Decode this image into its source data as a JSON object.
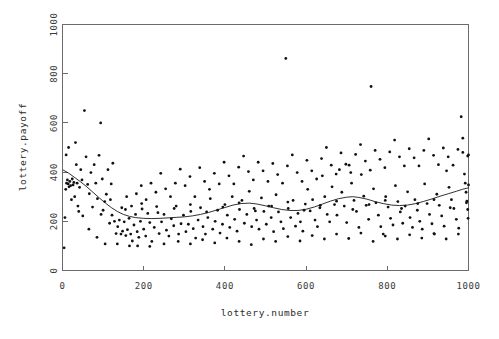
{
  "chart_data": {
    "type": "scatter",
    "title": "",
    "xlabel": "lottery.number",
    "ylabel": "lottery.payoff",
    "xlim": [
      0,
      1000
    ],
    "ylim": [
      0,
      1000
    ],
    "xticks": [
      0,
      200,
      400,
      600,
      800,
      1000
    ],
    "yticks": [
      0,
      200,
      400,
      600,
      800,
      1000
    ],
    "xtick_labels": [
      "0",
      "200",
      "400",
      "600",
      "800",
      "1000"
    ],
    "ytick_labels": [
      "0",
      "200",
      "400",
      "600",
      "800",
      "1000"
    ],
    "grid": false,
    "legend": null,
    "marker": "point",
    "marker_color": "#111111",
    "axis_color": "#6b6b6b",
    "curve": {
      "name": "lowess smooth",
      "color": "#1a1a1a",
      "points": [
        [
          2,
          408
        ],
        [
          15,
          396
        ],
        [
          30,
          378
        ],
        [
          45,
          360
        ],
        [
          60,
          340
        ],
        [
          75,
          318
        ],
        [
          90,
          296
        ],
        [
          105,
          275
        ],
        [
          120,
          256
        ],
        [
          135,
          240
        ],
        [
          150,
          228
        ],
        [
          165,
          220
        ],
        [
          180,
          215
        ],
        [
          200,
          212
        ],
        [
          220,
          211
        ],
        [
          240,
          212
        ],
        [
          260,
          214
        ],
        [
          280,
          216
        ],
        [
          300,
          218
        ],
        [
          320,
          222
        ],
        [
          340,
          228
        ],
        [
          360,
          236
        ],
        [
          380,
          246
        ],
        [
          400,
          256
        ],
        [
          420,
          266
        ],
        [
          440,
          272
        ],
        [
          460,
          274
        ],
        [
          480,
          270
        ],
        [
          500,
          263
        ],
        [
          520,
          255
        ],
        [
          540,
          248
        ],
        [
          560,
          244
        ],
        [
          580,
          244
        ],
        [
          600,
          249
        ],
        [
          620,
          258
        ],
        [
          640,
          270
        ],
        [
          660,
          282
        ],
        [
          680,
          292
        ],
        [
          700,
          298
        ],
        [
          715,
          300
        ],
        [
          730,
          297
        ],
        [
          750,
          290
        ],
        [
          770,
          280
        ],
        [
          790,
          272
        ],
        [
          810,
          266
        ],
        [
          830,
          264
        ],
        [
          850,
          266
        ],
        [
          870,
          272
        ],
        [
          890,
          281
        ],
        [
          910,
          291
        ],
        [
          930,
          302
        ],
        [
          950,
          312
        ],
        [
          970,
          322
        ],
        [
          985,
          330
        ],
        [
          1000,
          336
        ]
      ]
    },
    "points": [
      [
        4,
        92
      ],
      [
        6,
        215
      ],
      [
        8,
        330
      ],
      [
        9,
        470
      ],
      [
        10,
        355
      ],
      [
        12,
        368
      ],
      [
        14,
        352
      ],
      [
        15,
        500
      ],
      [
        16,
        340
      ],
      [
        18,
        362
      ],
      [
        20,
        345
      ],
      [
        22,
        288
      ],
      [
        24,
        372
      ],
      [
        26,
        348
      ],
      [
        28,
        358
      ],
      [
        30,
        300
      ],
      [
        32,
        520
      ],
      [
        34,
        430
      ],
      [
        36,
        355
      ],
      [
        38,
        262
      ],
      [
        40,
        240
      ],
      [
        42,
        338
      ],
      [
        45,
        410
      ],
      [
        48,
        368
      ],
      [
        50,
        222
      ],
      [
        54,
        650
      ],
      [
        58,
        462
      ],
      [
        62,
        350
      ],
      [
        66,
        312
      ],
      [
        70,
        398
      ],
      [
        74,
        258
      ],
      [
        78,
        430
      ],
      [
        82,
        355
      ],
      [
        86,
        292
      ],
      [
        90,
        468
      ],
      [
        94,
        600
      ],
      [
        98,
        372
      ],
      [
        100,
        245
      ],
      [
        104,
        280
      ],
      [
        108,
        310
      ],
      [
        112,
        410
      ],
      [
        116,
        192
      ],
      [
        120,
        352
      ],
      [
        124,
        436
      ],
      [
        128,
        200
      ],
      [
        132,
        150
      ],
      [
        136,
        178
      ],
      [
        140,
        205
      ],
      [
        144,
        148
      ],
      [
        148,
        160
      ],
      [
        152,
        198
      ],
      [
        156,
        142
      ],
      [
        160,
        166
      ],
      [
        164,
        212
      ],
      [
        168,
        148
      ],
      [
        172,
        120
      ],
      [
        176,
        185
      ],
      [
        180,
        228
      ],
      [
        184,
        158
      ],
      [
        188,
        135
      ],
      [
        192,
        200
      ],
      [
        196,
        250
      ],
      [
        200,
        168
      ],
      [
        205,
        140
      ],
      [
        210,
        232
      ],
      [
        215,
        195
      ],
      [
        220,
        118
      ],
      [
        226,
        175
      ],
      [
        232,
        260
      ],
      [
        238,
        150
      ],
      [
        244,
        198
      ],
      [
        250,
        228
      ],
      [
        256,
        164
      ],
      [
        262,
        140
      ],
      [
        268,
        210
      ],
      [
        274,
        182
      ],
      [
        280,
        262
      ],
      [
        286,
        148
      ],
      [
        292,
        190
      ],
      [
        298,
        225
      ],
      [
        304,
        158
      ],
      [
        310,
        188
      ],
      [
        316,
        240
      ],
      [
        322,
        170
      ],
      [
        328,
        132
      ],
      [
        334,
        205
      ],
      [
        340,
        255
      ],
      [
        346,
        178
      ],
      [
        352,
        148
      ],
      [
        358,
        215
      ],
      [
        364,
        292
      ],
      [
        370,
        168
      ],
      [
        376,
        200
      ],
      [
        382,
        245
      ],
      [
        388,
        152
      ],
      [
        394,
        188
      ],
      [
        400,
        268
      ],
      [
        406,
        225
      ],
      [
        412,
        175
      ],
      [
        418,
        300
      ],
      [
        424,
        208
      ],
      [
        430,
        160
      ],
      [
        436,
        248
      ],
      [
        442,
        285
      ],
      [
        448,
        192
      ],
      [
        454,
        228
      ],
      [
        460,
        322
      ],
      [
        466,
        178
      ],
      [
        472,
        252
      ],
      [
        478,
        205
      ],
      [
        484,
        168
      ],
      [
        490,
        295
      ],
      [
        496,
        240
      ],
      [
        502,
        188
      ],
      [
        508,
        262
      ],
      [
        514,
        215
      ],
      [
        520,
        158
      ],
      [
        526,
        308
      ],
      [
        532,
        238
      ],
      [
        538,
        198
      ],
      [
        544,
        170
      ],
      [
        550,
        862
      ],
      [
        556,
        252
      ],
      [
        562,
        215
      ],
      [
        568,
        285
      ],
      [
        574,
        180
      ],
      [
        580,
        232
      ],
      [
        586,
        198
      ],
      [
        592,
        160
      ],
      [
        598,
        270
      ],
      [
        604,
        330
      ],
      [
        610,
        242
      ],
      [
        616,
        288
      ],
      [
        622,
        205
      ],
      [
        628,
        178
      ],
      [
        634,
        255
      ],
      [
        640,
        385
      ],
      [
        646,
        300
      ],
      [
        652,
        228
      ],
      [
        658,
        198
      ],
      [
        664,
        340
      ],
      [
        670,
        268
      ],
      [
        676,
        225
      ],
      [
        682,
        410
      ],
      [
        688,
        318
      ],
      [
        694,
        262
      ],
      [
        700,
        195
      ],
      [
        706,
        428
      ],
      [
        712,
        355
      ],
      [
        718,
        285
      ],
      [
        724,
        240
      ],
      [
        730,
        175
      ],
      [
        736,
        390
      ],
      [
        742,
        302
      ],
      [
        748,
        265
      ],
      [
        754,
        208
      ],
      [
        760,
        748
      ],
      [
        766,
        332
      ],
      [
        772,
        275
      ],
      [
        778,
        225
      ],
      [
        784,
        178
      ],
      [
        790,
        148
      ],
      [
        796,
        300
      ],
      [
        802,
        258
      ],
      [
        808,
        212
      ],
      [
        814,
        185
      ],
      [
        820,
        345
      ],
      [
        826,
        280
      ],
      [
        832,
        238
      ],
      [
        838,
        192
      ],
      [
        844,
        262
      ],
      [
        850,
        320
      ],
      [
        856,
        215
      ],
      [
        862,
        175
      ],
      [
        868,
        288
      ],
      [
        874,
        245
      ],
      [
        880,
        200
      ],
      [
        886,
        168
      ],
      [
        892,
        352
      ],
      [
        898,
        272
      ],
      [
        904,
        228
      ],
      [
        910,
        190
      ],
      [
        916,
        148
      ],
      [
        922,
        310
      ],
      [
        928,
        265
      ],
      [
        934,
        222
      ],
      [
        940,
        180
      ],
      [
        946,
        405
      ],
      [
        952,
        338
      ],
      [
        958,
        288
      ],
      [
        964,
        252
      ],
      [
        970,
        208
      ],
      [
        976,
        172
      ],
      [
        982,
        625
      ],
      [
        986,
        480
      ],
      [
        990,
        392
      ],
      [
        992,
        355
      ],
      [
        994,
        318
      ],
      [
        996,
        282
      ],
      [
        998,
        248
      ],
      [
        999,
        212
      ],
      [
        1000,
        470
      ],
      [
        1000,
        348
      ],
      [
        118,
        288
      ],
      [
        122,
        225
      ],
      [
        146,
        255
      ],
      [
        158,
        300
      ],
      [
        170,
        262
      ],
      [
        182,
        312
      ],
      [
        194,
        345
      ],
      [
        206,
        288
      ],
      [
        218,
        355
      ],
      [
        230,
        318
      ],
      [
        242,
        395
      ],
      [
        254,
        332
      ],
      [
        266,
        300
      ],
      [
        278,
        355
      ],
      [
        290,
        412
      ],
      [
        302,
        345
      ],
      [
        314,
        382
      ],
      [
        326,
        300
      ],
      [
        338,
        418
      ],
      [
        350,
        362
      ],
      [
        362,
        330
      ],
      [
        374,
        395
      ],
      [
        386,
        352
      ],
      [
        398,
        440
      ],
      [
        410,
        385
      ],
      [
        422,
        352
      ],
      [
        434,
        420
      ],
      [
        446,
        465
      ],
      [
        458,
        402
      ],
      [
        470,
        368
      ],
      [
        482,
        440
      ],
      [
        494,
        405
      ],
      [
        506,
        362
      ],
      [
        518,
        435
      ],
      [
        530,
        390
      ],
      [
        542,
        355
      ],
      [
        554,
        425
      ],
      [
        566,
        470
      ],
      [
        578,
        398
      ],
      [
        590,
        362
      ],
      [
        602,
        448
      ],
      [
        614,
        405
      ],
      [
        626,
        372
      ],
      [
        638,
        455
      ],
      [
        650,
        500
      ],
      [
        662,
        428
      ],
      [
        674,
        392
      ],
      [
        686,
        478
      ],
      [
        698,
        432
      ],
      [
        710,
        398
      ],
      [
        722,
        472
      ],
      [
        734,
        512
      ],
      [
        746,
        445
      ],
      [
        758,
        408
      ],
      [
        770,
        488
      ],
      [
        782,
        452
      ],
      [
        794,
        418
      ],
      [
        806,
        482
      ],
      [
        818,
        530
      ],
      [
        830,
        462
      ],
      [
        842,
        425
      ],
      [
        854,
        495
      ],
      [
        866,
        458
      ],
      [
        878,
        425
      ],
      [
        890,
        488
      ],
      [
        902,
        535
      ],
      [
        914,
        468
      ],
      [
        926,
        430
      ],
      [
        938,
        498
      ],
      [
        950,
        462
      ],
      [
        962,
        428
      ],
      [
        974,
        492
      ],
      [
        986,
        538
      ],
      [
        998,
        465
      ],
      [
        65,
        168
      ],
      [
        85,
        135
      ],
      [
        105,
        108
      ],
      [
        135,
        108
      ],
      [
        165,
        100
      ],
      [
        185,
        100
      ],
      [
        215,
        98
      ],
      [
        250,
        108
      ],
      [
        285,
        118
      ],
      [
        315,
        108
      ],
      [
        345,
        125
      ],
      [
        375,
        112
      ],
      [
        405,
        132
      ],
      [
        435,
        118
      ],
      [
        465,
        105
      ],
      [
        495,
        128
      ],
      [
        525,
        118
      ],
      [
        555,
        138
      ],
      [
        585,
        120
      ],
      [
        615,
        142
      ],
      [
        645,
        128
      ],
      [
        675,
        148
      ],
      [
        705,
        130
      ],
      [
        735,
        152
      ],
      [
        765,
        118
      ],
      [
        795,
        140
      ],
      [
        825,
        128
      ],
      [
        855,
        145
      ],
      [
        885,
        132
      ],
      [
        915,
        150
      ],
      [
        945,
        128
      ],
      [
        975,
        148
      ],
      [
        95,
        228
      ],
      [
        155,
        248
      ],
      [
        195,
        272
      ],
      [
        235,
        235
      ],
      [
        275,
        252
      ],
      [
        315,
        268
      ],
      [
        355,
        238
      ],
      [
        395,
        258
      ],
      [
        435,
        275
      ],
      [
        475,
        242
      ],
      [
        515,
        262
      ],
      [
        555,
        278
      ],
      [
        595,
        245
      ],
      [
        635,
        265
      ],
      [
        675,
        282
      ],
      [
        715,
        248
      ],
      [
        755,
        268
      ],
      [
        795,
        285
      ],
      [
        835,
        252
      ],
      [
        875,
        272
      ],
      [
        915,
        288
      ],
      [
        955,
        255
      ],
      [
        995,
        275
      ]
    ]
  }
}
